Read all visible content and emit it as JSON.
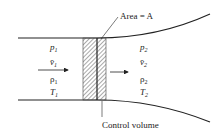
{
  "diagram": {
    "type": "control-volume-duct",
    "area_label": "Area = A",
    "control_volume_label": "Control volume",
    "inlet": {
      "pressure": "p",
      "velocity": "v̄",
      "density": "ρ",
      "temperature": "T",
      "subscript": "1"
    },
    "outlet": {
      "pressure": "p",
      "velocity": "v̄",
      "density": "ρ",
      "temperature": "T",
      "subscript": "2"
    },
    "colors": {
      "line": "#222222",
      "hatch": "#555555",
      "background": "#ffffff"
    }
  }
}
